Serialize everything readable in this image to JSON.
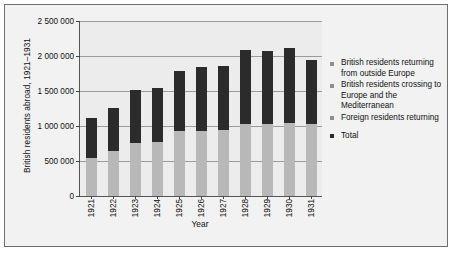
{
  "chart_data": {
    "type": "bar",
    "title": "",
    "xlabel": "Year",
    "ylabel": "British residents abroad, 1921–1931",
    "ylim": [
      0,
      2500000
    ],
    "ytick_labels": [
      "0",
      "500 000",
      "1 000 000",
      "1 500 000",
      "2 000 000",
      "2 500 000"
    ],
    "ytick_values": [
      0,
      500000,
      1000000,
      1500000,
      2000000,
      2500000
    ],
    "grid": true,
    "legend_position": "right",
    "categories": [
      "1921",
      "1922",
      "1923",
      "1924",
      "1925",
      "1926",
      "1927",
      "1928",
      "1929",
      "1930",
      "1931"
    ],
    "series": [
      {
        "name": "Foreign residents returning",
        "color": "#b8b8b8",
        "values": [
          550000,
          640000,
          760000,
          770000,
          930000,
          930000,
          950000,
          1030000,
          1030000,
          1040000,
          1030000
        ]
      },
      {
        "name": "Total",
        "color": "#2b2b2b",
        "values": [
          1120000,
          1260000,
          1520000,
          1550000,
          1780000,
          1840000,
          1860000,
          2080000,
          2070000,
          2120000,
          1940000
        ]
      }
    ],
    "legend": [
      {
        "label": "British residents returning from outside Europe",
        "color": "#8f8f8f"
      },
      {
        "label": "British residents crossing to Europe and the Mediterranean",
        "color": "#8f8f8f"
      },
      {
        "label": "Foreign residents returning",
        "color": "#8f8f8f"
      },
      {
        "label": "Total",
        "color": "#2b2b2b"
      }
    ]
  }
}
